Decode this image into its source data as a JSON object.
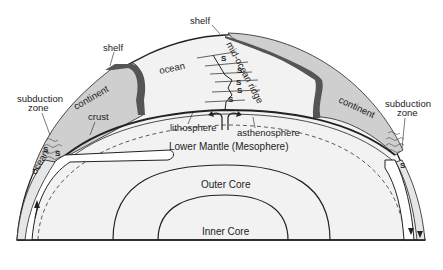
{
  "diagram": {
    "colors": {
      "ocean_fill": "#f2f2f2",
      "continent_fill": "#cfcfcf",
      "shelf_dark": "#555555",
      "line": "#222222",
      "background": "#ffffff"
    },
    "labels": {
      "shelf_left": "shelf",
      "shelf_top": "shelf",
      "ocean_top": "ocean",
      "mid_ocean_ridge": "mid-ocean ridge",
      "continent_left": "continent",
      "continent_right": "continent",
      "crust": "crust",
      "subduction_zone_left_1": "subduction",
      "subduction_zone_left_2": "zone",
      "subduction_zone_right_1": "subduction",
      "subduction_zone_right_2": "zone",
      "lithosphere": "lithosphere",
      "asthenosphere": "asthenosphere",
      "lower_mantle": "Lower Mantle (Mesophere)",
      "outer_core": "Outer Core",
      "inner_core": "Inner Core",
      "ocean_left": "ocean",
      "s_marker": "S"
    },
    "ridge_s_count": 5,
    "subduction_s_markers_left": 2,
    "subduction_s_markers_right": 1
  }
}
